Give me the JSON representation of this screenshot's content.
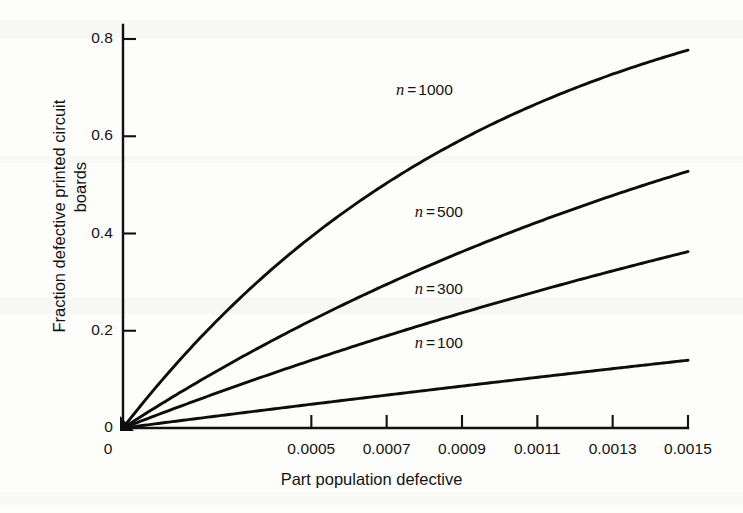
{
  "chart_data": {
    "type": "line",
    "title": "",
    "xlabel": "Part population defective",
    "ylabel": "Fraction defective printed circuit boards",
    "ylabel_line1": "Fraction defective printed circuit",
    "ylabel_line2": "boards",
    "xlim": [
      0,
      0.0015
    ],
    "ylim": [
      0,
      0.8
    ],
    "grid": false,
    "legend_position": "inline-annotation",
    "xticks": [
      0,
      0.0005,
      0.0007,
      0.0009,
      0.0011,
      0.0013,
      0.0015
    ],
    "xtick_labels": [
      "0",
      "0.0005",
      "0.0007",
      "0.0009",
      "0.0011",
      "0.0013",
      "0.0015"
    ],
    "yticks": [
      0,
      0.2,
      0.4,
      0.6,
      0.8
    ],
    "ytick_labels": [
      "0",
      "0.2",
      "0.4",
      "0.6",
      "0.8"
    ],
    "model": "1 - (1 - p)^n",
    "series": [
      {
        "name": "n = 1000",
        "n": 1000,
        "label_prefix": "n",
        "label_eq": "=",
        "label_value": "1000",
        "x": [
          0,
          0.0001,
          0.0002,
          0.0003,
          0.0004,
          0.0005,
          0.0006,
          0.0007,
          0.0008,
          0.0009,
          0.001,
          0.0011,
          0.0012,
          0.0013,
          0.0014,
          0.0015
        ],
        "values": [
          0,
          0.095,
          0.181,
          0.259,
          0.33,
          0.394,
          0.451,
          0.504,
          0.551,
          0.593,
          0.632,
          0.667,
          0.699,
          0.728,
          0.753,
          0.777
        ]
      },
      {
        "name": "n = 500",
        "n": 500,
        "label_prefix": "n",
        "label_eq": "=",
        "label_value": "500",
        "x": [
          0,
          0.0001,
          0.0002,
          0.0003,
          0.0004,
          0.0005,
          0.0006,
          0.0007,
          0.0008,
          0.0009,
          0.001,
          0.0011,
          0.0012,
          0.0013,
          0.0014,
          0.0015
        ],
        "values": [
          0,
          0.049,
          0.095,
          0.139,
          0.181,
          0.221,
          0.259,
          0.295,
          0.33,
          0.362,
          0.394,
          0.423,
          0.451,
          0.478,
          0.504,
          0.528
        ]
      },
      {
        "name": "n = 300",
        "n": 300,
        "label_prefix": "n",
        "label_eq": "=",
        "label_value": "300",
        "x": [
          0,
          0.0001,
          0.0002,
          0.0003,
          0.0004,
          0.0005,
          0.0006,
          0.0007,
          0.0008,
          0.0009,
          0.001,
          0.0011,
          0.0012,
          0.0013,
          0.0014,
          0.0015
        ],
        "values": [
          0,
          0.03,
          0.058,
          0.086,
          0.113,
          0.139,
          0.165,
          0.189,
          0.213,
          0.236,
          0.259,
          0.281,
          0.302,
          0.323,
          0.343,
          0.362
        ]
      },
      {
        "name": "n = 100",
        "n": 100,
        "label_prefix": "n",
        "label_eq": "=",
        "label_value": "100",
        "x": [
          0,
          0.0001,
          0.0002,
          0.0003,
          0.0004,
          0.0005,
          0.0006,
          0.0007,
          0.0008,
          0.0009,
          0.001,
          0.0011,
          0.0012,
          0.0013,
          0.0014,
          0.0015
        ],
        "values": [
          0,
          0.01,
          0.02,
          0.03,
          0.039,
          0.049,
          0.058,
          0.068,
          0.077,
          0.086,
          0.095,
          0.104,
          0.113,
          0.122,
          0.131,
          0.139
        ]
      }
    ],
    "annotations": [
      {
        "text": "n = 1000",
        "x": 0.00073,
        "y": 0.695
      },
      {
        "text": "n = 500",
        "x": 0.00078,
        "y": 0.445
      },
      {
        "text": "n = 300",
        "x": 0.00078,
        "y": 0.285
      },
      {
        "text": "n = 100",
        "x": 0.00078,
        "y": 0.175
      }
    ],
    "colors": {
      "curve": "#0d0d0d",
      "axis": "#111111",
      "text": "#131313",
      "background": "#fdfdfb"
    }
  }
}
